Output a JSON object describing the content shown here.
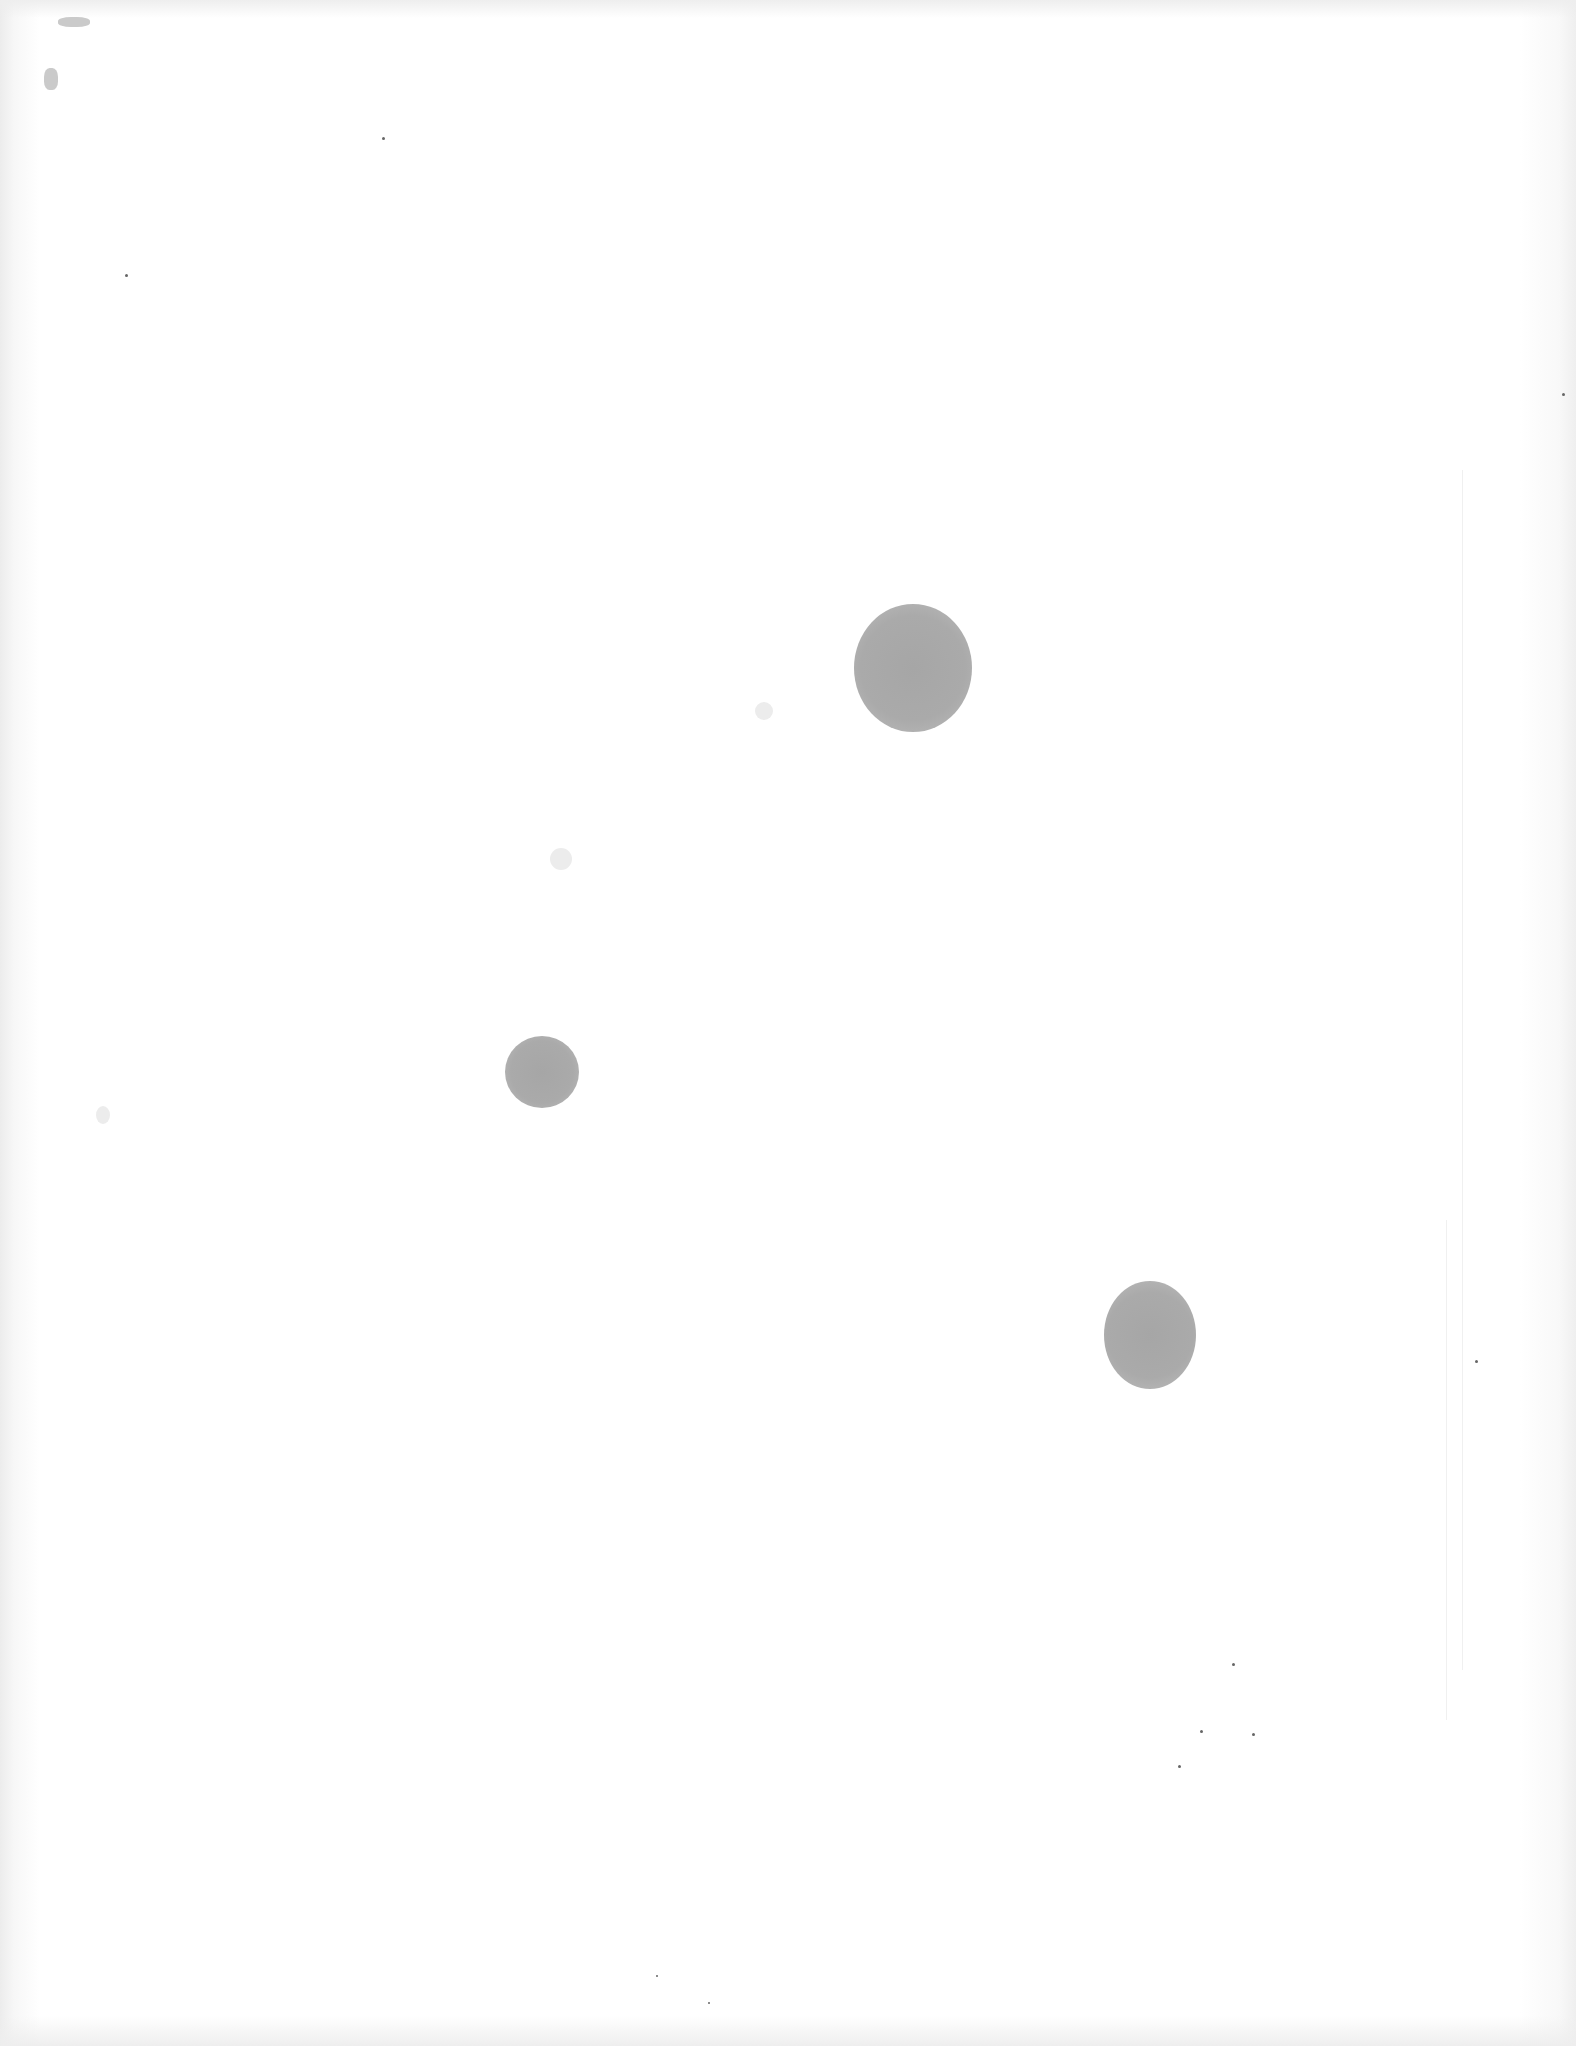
{
  "document": {
    "type": "scanned-blank-page",
    "text_content": "",
    "background_color": "#ffffff",
    "mark_color": "#a8a8a8",
    "marks": [
      {
        "name": "large-blot",
        "cx": 913,
        "cy": 668,
        "w": 118,
        "h": 128
      },
      {
        "name": "medium-blot",
        "cx": 542,
        "cy": 1072,
        "w": 74,
        "h": 72
      },
      {
        "name": "oval-blot",
        "cx": 1150,
        "cy": 1335,
        "w": 92,
        "h": 108
      }
    ]
  }
}
